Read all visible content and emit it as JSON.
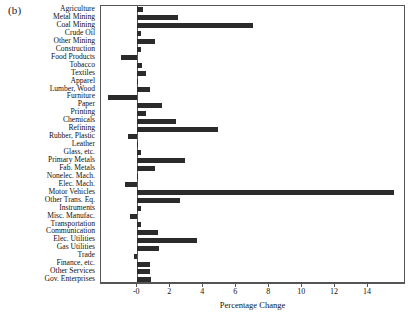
{
  "figure": {
    "panel_label": "(b)",
    "axis_color": "#555555",
    "bar_color": "#2b2b2b"
  },
  "chart_data": {
    "type": "bar",
    "orientation": "horizontal",
    "title": "",
    "subtitle": "",
    "xlabel": "Percentage Change",
    "ylabel": "",
    "xlim": [
      -2.2,
      16.3
    ],
    "grid": false,
    "legend": null,
    "xticks": [
      0,
      2,
      4,
      6,
      8,
      10,
      12,
      14
    ],
    "xticklabels": [
      "-0",
      "2",
      "4",
      "6",
      "8",
      "10",
      "12",
      "14"
    ],
    "categories": [
      "Agriculture",
      "Metal Mining",
      "Coal Mining",
      "Crude Oil",
      "Other Mining",
      "Construction",
      "Food Products",
      "Tobacco",
      "Textiles",
      "Apparel",
      "Lumber, Wood",
      "Furniture",
      "Paper",
      "Printing",
      "Chemicals",
      "Refining",
      "Rubber, Plastic",
      "Leather",
      "Glass, etc.",
      "Primary Metals",
      "Fab. Metals",
      "Nonelec. Mach.",
      "Elec. Mach.",
      "Motor Vehicles",
      "Other Trans. Eq.",
      "Instruments",
      "Misc. Manufac.",
      "Transportation",
      "Communication",
      "Elec. Utilities",
      "Gas Utilities",
      "Trade",
      "Finance, etc.",
      "Other Services",
      "Gov. Enterprises"
    ],
    "values": [
      0.35,
      2.45,
      7.05,
      0.2,
      1.1,
      0.2,
      -1.0,
      0.3,
      0.55,
      0.05,
      0.8,
      -1.8,
      1.5,
      0.5,
      2.35,
      4.9,
      -0.55,
      0.02,
      0.2,
      2.9,
      1.1,
      0.05,
      -0.75,
      15.6,
      2.6,
      0.25,
      -0.45,
      0.2,
      1.25,
      3.6,
      1.3,
      -0.2,
      0.75,
      0.8,
      0.85
    ]
  }
}
